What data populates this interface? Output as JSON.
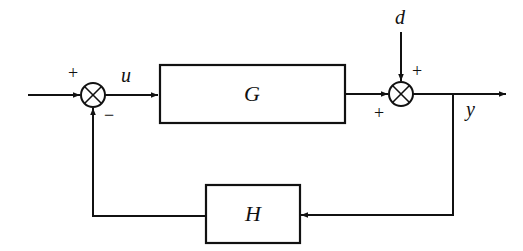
{
  "diagram": {
    "type": "feedback-control-block-diagram",
    "blocks": [
      {
        "id": "G",
        "label": "G"
      },
      {
        "id": "H",
        "label": "H"
      }
    ],
    "signals": {
      "u": "u",
      "d": "d",
      "y": "y"
    },
    "summing_junctions": [
      {
        "id": "sum1",
        "signs": {
          "input": "+",
          "feedback": "−"
        }
      },
      {
        "id": "sum2",
        "signs": {
          "from_G": "+",
          "disturbance": "+"
        }
      }
    ],
    "colors": {
      "stroke": "#111111",
      "background": "#ffffff"
    }
  }
}
